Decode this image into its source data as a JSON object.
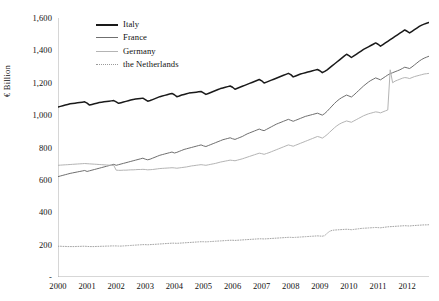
{
  "chart_data": {
    "type": "line",
    "title": "",
    "xlabel": "",
    "ylabel": "€ Billion",
    "ylim": [
      0,
      1600
    ],
    "xlim": [
      2000,
      2012.75
    ],
    "grid": false,
    "legend_position": "top-center",
    "ytick_labels": [
      "1,600",
      "1,400",
      "1,200",
      "1,000",
      "800",
      "600",
      "400",
      "200",
      "-"
    ],
    "ytick_values": [
      1600,
      1400,
      1200,
      1000,
      800,
      600,
      400,
      200,
      0
    ],
    "categories": [
      "2000",
      "2001",
      "2002",
      "2003",
      "2004",
      "2005",
      "2006",
      "2007",
      "2008",
      "2009",
      "2010",
      "2011",
      "2012"
    ],
    "x": [
      2000,
      2001,
      2002,
      2003,
      2004,
      2005,
      2006,
      2007,
      2008,
      2009,
      2010,
      2011,
      2012
    ],
    "series": [
      {
        "name": "Italy",
        "color": "#1a1a1a",
        "width": 1.5,
        "dash": "solid",
        "values": [
          1050,
          1075,
          1085,
          1105,
          1140,
          1150,
          1190,
          1230,
          1270,
          1310,
          1395,
          1460,
          1520
        ],
        "monthly": [
          1050,
          1054,
          1058,
          1062,
          1066,
          1070,
          1072,
          1074,
          1076,
          1078,
          1080,
          1082,
          1074,
          1062,
          1066,
          1070,
          1074,
          1078,
          1080,
          1082,
          1084,
          1086,
          1088,
          1090,
          1082,
          1073,
          1077,
          1081,
          1085,
          1089,
          1093,
          1097,
          1099,
          1101,
          1103,
          1105,
          1096,
          1086,
          1090,
          1096,
          1102,
          1108,
          1114,
          1118,
          1122,
          1126,
          1130,
          1134,
          1126,
          1114,
          1118,
          1124,
          1128,
          1132,
          1136,
          1138,
          1140,
          1142,
          1144,
          1146,
          1138,
          1128,
          1134,
          1140,
          1146,
          1152,
          1158,
          1164,
          1168,
          1172,
          1176,
          1180,
          1172,
          1160,
          1166,
          1172,
          1178,
          1184,
          1190,
          1196,
          1202,
          1208,
          1214,
          1220,
          1212,
          1198,
          1204,
          1210,
          1216,
          1222,
          1228,
          1234,
          1240,
          1246,
          1252,
          1258,
          1250,
          1236,
          1242,
          1248,
          1254,
          1258,
          1262,
          1266,
          1270,
          1274,
          1278,
          1282,
          1274,
          1262,
          1270,
          1280,
          1292,
          1304,
          1316,
          1328,
          1340,
          1352,
          1364,
          1376,
          1368,
          1356,
          1366,
          1376,
          1386,
          1396,
          1406,
          1414,
          1422,
          1430,
          1438,
          1446,
          1438,
          1426,
          1436,
          1446,
          1456,
          1466,
          1476,
          1486,
          1496,
          1506,
          1516,
          1526,
          1518,
          1508,
          1518,
          1528,
          1538,
          1548,
          1556,
          1562,
          1568,
          1572,
          1576,
          1580
        ]
      },
      {
        "name": "France",
        "color": "#6f6f6f",
        "width": 1.0,
        "dash": "solid",
        "values": [
          620,
          650,
          690,
          730,
          775,
          815,
          860,
          910,
          960,
          1010,
          1120,
          1240,
          1350
        ],
        "monthly": [
          620,
          624,
          628,
          632,
          636,
          640,
          643,
          646,
          649,
          652,
          655,
          658,
          652,
          656,
          660,
          664,
          668,
          672,
          676,
          680,
          684,
          688,
          692,
          696,
          690,
          694,
          698,
          702,
          706,
          710,
          714,
          718,
          722,
          726,
          730,
          734,
          728,
          724,
          728,
          734,
          740,
          746,
          752,
          756,
          760,
          764,
          768,
          772,
          766,
          770,
          776,
          782,
          788,
          792,
          796,
          800,
          804,
          808,
          812,
          816,
          810,
          806,
          812,
          818,
          824,
          830,
          836,
          842,
          848,
          852,
          856,
          860,
          854,
          850,
          856,
          862,
          868,
          876,
          884,
          890,
          896,
          902,
          908,
          914,
          908,
          904,
          912,
          920,
          928,
          936,
          944,
          950,
          956,
          962,
          968,
          974,
          968,
          962,
          968,
          974,
          980,
          986,
          992,
          996,
          1000,
          1004,
          1008,
          1012,
          1006,
          1000,
          1010,
          1024,
          1040,
          1056,
          1072,
          1086,
          1098,
          1108,
          1116,
          1124,
          1118,
          1112,
          1124,
          1138,
          1152,
          1166,
          1180,
          1192,
          1204,
          1214,
          1222,
          1230,
          1224,
          1218,
          1228,
          1238,
          1248,
          1256,
          1262,
          1268,
          1274,
          1280,
          1288,
          1296,
          1292,
          1288,
          1298,
          1310,
          1322,
          1334,
          1344,
          1352,
          1358,
          1364,
          1368,
          1372
        ]
      },
      {
        "name": "Germany",
        "color": "#b4b4b4",
        "width": 1.0,
        "dash": "solid",
        "values": [
          690,
          695,
          660,
          670,
          690,
          715,
          750,
          790,
          830,
          900,
          1000,
          1220,
          1250
        ],
        "monthly": [
          690,
          691,
          692,
          693,
          694,
          695,
          696,
          697,
          698,
          699,
          700,
          701,
          700,
          699,
          698,
          697,
          696,
          695,
          694,
          693,
          692,
          691,
          690,
          689,
          660,
          659,
          659,
          660,
          660,
          661,
          662,
          662,
          663,
          664,
          664,
          665,
          664,
          662,
          663,
          664,
          666,
          668,
          670,
          671,
          672,
          673,
          674,
          675,
          674,
          672,
          674,
          676,
          678,
          680,
          683,
          686,
          688,
          690,
          692,
          694,
          692,
          690,
          693,
          696,
          699,
          702,
          706,
          710,
          713,
          716,
          719,
          722,
          720,
          718,
          722,
          726,
          730,
          735,
          740,
          745,
          750,
          755,
          760,
          765,
          762,
          758,
          763,
          768,
          774,
          780,
          786,
          792,
          798,
          804,
          810,
          816,
          812,
          808,
          814,
          820,
          826,
          832,
          838,
          844,
          850,
          856,
          862,
          868,
          864,
          858,
          868,
          880,
          894,
          908,
          922,
          934,
          944,
          952,
          958,
          964,
          960,
          956,
          964,
          972,
          980,
          988,
          996,
          1002,
          1008,
          1012,
          1016,
          1020,
          1018,
          1014,
          1020,
          1026,
          1032,
          1280,
          1200,
          1210,
          1216,
          1222,
          1228,
          1232,
          1230,
          1226,
          1232,
          1238,
          1242,
          1246,
          1250,
          1254,
          1256,
          1258,
          1260,
          1262
        ]
      },
      {
        "name": "the Netherlands",
        "color": "#9a9a9a",
        "width": 0.9,
        "dash": "dotted",
        "values": [
          190,
          188,
          192,
          200,
          208,
          215,
          222,
          232,
          240,
          250,
          290,
          305,
          320
        ],
        "monthly": [
          190,
          190,
          189,
          189,
          188,
          188,
          188,
          188,
          189,
          189,
          190,
          190,
          189,
          188,
          188,
          188,
          189,
          189,
          190,
          190,
          191,
          191,
          192,
          192,
          192,
          191,
          191,
          192,
          193,
          194,
          195,
          196,
          197,
          198,
          199,
          200,
          200,
          199,
          200,
          201,
          202,
          203,
          204,
          205,
          206,
          207,
          208,
          209,
          209,
          208,
          209,
          210,
          211,
          212,
          213,
          214,
          215,
          216,
          217,
          218,
          218,
          217,
          218,
          219,
          220,
          221,
          222,
          223,
          224,
          225,
          226,
          227,
          227,
          226,
          227,
          228,
          229,
          230,
          231,
          232,
          233,
          234,
          235,
          236,
          236,
          235,
          236,
          237,
          238,
          239,
          240,
          241,
          242,
          243,
          244,
          245,
          245,
          244,
          245,
          246,
          247,
          248,
          249,
          250,
          251,
          252,
          253,
          254,
          253,
          252,
          256,
          270,
          282,
          288,
          290,
          291,
          292,
          293,
          294,
          295,
          294,
          292,
          294,
          296,
          298,
          300,
          301,
          302,
          303,
          304,
          305,
          306,
          305,
          304,
          306,
          308,
          310,
          311,
          312,
          313,
          314,
          315,
          316,
          317,
          316,
          315,
          317,
          318,
          319,
          320,
          321,
          322,
          322,
          323,
          323,
          324
        ]
      }
    ]
  }
}
